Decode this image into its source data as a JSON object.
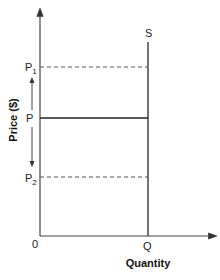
{
  "diagram": {
    "title": "",
    "y_axis_label": "Price ($)",
    "x_axis_label": "Quantity",
    "origin_label": "0",
    "supply_curve_label": "S",
    "quantity_label": "Q",
    "price_levels": [
      {
        "name": "P1",
        "base": "P",
        "subscript": "1",
        "style": "dashed"
      },
      {
        "name": "P",
        "base": "P",
        "subscript": "",
        "style": "solid"
      },
      {
        "name": "P2",
        "base": "P",
        "subscript": "2",
        "style": "dashed"
      }
    ],
    "supply_type": "perfectly inelastic (vertical)",
    "price_arrow": "double-headed arrow from P pointing up to P1 and down to P2",
    "line_color": "#333333"
  }
}
